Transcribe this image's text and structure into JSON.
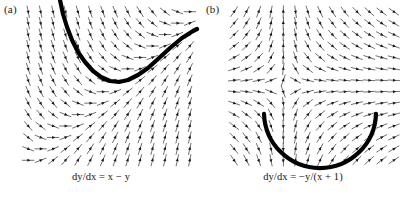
{
  "figure": {
    "width": 404,
    "height": 197,
    "background_color": "#ffffff",
    "arrow_color": "#1a1a1a",
    "solution_curve_color": "#000000"
  },
  "panels": [
    {
      "label": "(a)",
      "caption": "dy/dx = x − y",
      "equation": "dy/dx = x - y",
      "field": {
        "type": "slope_field",
        "x_range": [
          -3.0,
          3.0
        ],
        "y_range": [
          -3.0,
          3.0
        ],
        "grid_cols": 14,
        "grid_rows": 14,
        "plot_box": [
          22,
          6,
          174,
          160
        ]
      },
      "solution_curve": {
        "description": "particular solution curve y = x - 1 + C e^{-x}, descending from upper-left, minimum near center-bottom, rising to upper-right",
        "points": [
          [
            60,
            0
          ],
          [
            63,
            14
          ],
          [
            67,
            27
          ],
          [
            72,
            40
          ],
          [
            78,
            52
          ],
          [
            85,
            62
          ],
          [
            93,
            71
          ],
          [
            101,
            77
          ],
          [
            110,
            81
          ],
          [
            119,
            82
          ],
          [
            128,
            80
          ],
          [
            138,
            75
          ],
          [
            148,
            68
          ],
          [
            158,
            59
          ],
          [
            170,
            48
          ],
          [
            182,
            38
          ],
          [
            193,
            31
          ],
          [
            197,
            29
          ]
        ],
        "stroke_width": 4.2
      }
    },
    {
      "label": "(b)",
      "caption": "dy/dx = −y/(x + 1)",
      "equation": "dy/dx = -y/(x + 1)",
      "field": {
        "type": "slope_field",
        "x_range": [
          -3.0,
          3.0
        ],
        "y_range": [
          -3.0,
          3.0
        ],
        "grid_cols": 14,
        "grid_rows": 14,
        "plot_box": [
          26,
          6,
          172,
          160
        ]
      },
      "solution_curve": {
        "description": "lower semicircular arc of the circular solution family centred on the singular point",
        "center": [
          118,
          112
        ],
        "radius": 56,
        "start_angle_deg": 178,
        "end_angle_deg": 2,
        "stroke_width": 4.2
      }
    }
  ]
}
